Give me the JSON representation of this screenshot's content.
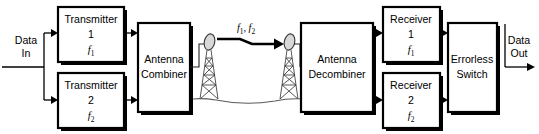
{
  "diagram": {
    "input": {
      "line1": "Data",
      "line2": "In"
    },
    "output": {
      "line1": "Data",
      "line2": "Out"
    },
    "path_label": {
      "f1_base": "f",
      "f1_sub": "1",
      "separator": ", ",
      "f2_base": "f",
      "f2_sub": "2"
    },
    "blocks": [
      {
        "id": "transmitter-1",
        "line1": "Transmitter",
        "line2": "1",
        "freq_base": "f",
        "freq_sub": "1"
      },
      {
        "id": "transmitter-2",
        "line1": "Transmitter",
        "line2": "2",
        "freq_base": "f",
        "freq_sub": "2"
      },
      {
        "id": "antenna-combiner",
        "line1": "Antenna",
        "line2": "Combiner"
      },
      {
        "id": "antenna-decombiner",
        "line1": "Antenna",
        "line2": "Decombiner"
      },
      {
        "id": "receiver-1",
        "line1": "Receiver",
        "line2": "1",
        "freq_base": "f",
        "freq_sub": "1"
      },
      {
        "id": "receiver-2",
        "line1": "Receiver",
        "line2": "2",
        "freq_base": "f",
        "freq_sub": "2"
      },
      {
        "id": "errorless-switch",
        "line1": "Errorless",
        "line2": "Switch"
      }
    ],
    "antennas": [
      {
        "id": "transmit-tower",
        "role": "transmit"
      },
      {
        "id": "receive-tower",
        "role": "receive"
      }
    ],
    "colors": {
      "stroke": "#000000",
      "background": "#ffffff",
      "tower": "#3a3a3a",
      "ground": "#5a5a5a",
      "dish_fill": "#d8d8d8"
    }
  }
}
